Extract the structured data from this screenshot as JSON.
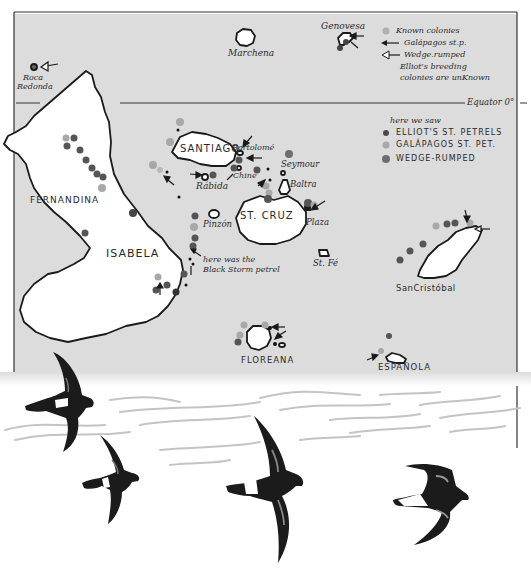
{
  "colors": {
    "sea": "#dcdcdc",
    "land": "#ffffff",
    "outline": "#1a1a1a",
    "elliots_dot": "#4a4a4a",
    "galapagos_dot": "#a8a8a8",
    "wedge_dot": "#6e6e6e",
    "bird": "#1b1b1b"
  },
  "map": {
    "equator_label": "Equator 0°",
    "islands": [
      {
        "name": "Marchena"
      },
      {
        "name": "Genovesa"
      },
      {
        "name": "Roca Redonda",
        "line1": "Roca",
        "line2": "Redonda"
      },
      {
        "name": "FERNANDINA"
      },
      {
        "name": "ISABELA"
      },
      {
        "name": "SANTIAGO"
      },
      {
        "name": "Bartolomé"
      },
      {
        "name": "Chinese Hat",
        "short": "Chine"
      },
      {
        "name": "Rábida"
      },
      {
        "name": "Seymour"
      },
      {
        "name": "Baltra"
      },
      {
        "name": "ST. CRUZ"
      },
      {
        "name": "Plaza"
      },
      {
        "name": "Pinzón"
      },
      {
        "name": "St. Fé"
      },
      {
        "name": "SanCristóbal"
      },
      {
        "name": "FLOREANA"
      },
      {
        "name": "ESPAÑOLA"
      }
    ],
    "annotation": {
      "line1": "here was the",
      "line2": "Black Storm petrel"
    }
  },
  "legend_top": {
    "known_colonies": "Known colonies",
    "galapagos_sp": "Galápagos st.p.",
    "wedge_rumped": "Wedge.rumped",
    "elliots_note_1": "Elliot's breeding",
    "elliots_note_2": "colonies are unKnown"
  },
  "legend_seen": {
    "title": "here we saw",
    "items": [
      {
        "label": "ELLIOT'S ST. PETRELS"
      },
      {
        "label": "GALÁPAGOS ST. PET."
      },
      {
        "label": "WEDGE-RUMPED"
      }
    ]
  },
  "illustration": {
    "birds": [
      {
        "species": "Elliot's storm petrel"
      },
      {
        "species": "Elliot's storm petrel"
      },
      {
        "species": "Galápagos storm petrel"
      },
      {
        "species": "Wedge-rumped storm petrel"
      }
    ]
  }
}
